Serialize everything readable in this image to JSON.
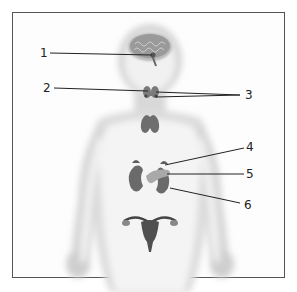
{
  "diagram": {
    "colors": {
      "frame": "#555555",
      "body": "#eeeeee",
      "organs": "#6e6e6e",
      "leader_lines": "#222222"
    },
    "labels": [
      {
        "number": "1",
        "target": "pituitary-hypothalamus"
      },
      {
        "number": "2",
        "target": "thyroid"
      },
      {
        "number": "3",
        "target": "parathyroid"
      },
      {
        "number": "4",
        "target": "adrenal-gland"
      },
      {
        "number": "5",
        "target": "pancreas"
      },
      {
        "number": "6",
        "target": "kidney"
      }
    ]
  }
}
